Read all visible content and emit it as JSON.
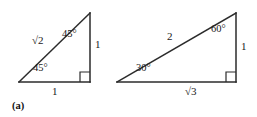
{
  "figure": {
    "caption": "(a)",
    "stroke_color": "#2b2b2b",
    "text_color": "#1a1a1a",
    "background_color": "#ffffff",
    "triangles": [
      {
        "name": "45-45-90-triangle",
        "hypotenuse_label": "√2",
        "vertical_leg_label": "1",
        "base_label": "1",
        "apex_angle_label": "45°",
        "base_angle_label": "45°",
        "right_angle_marker": true,
        "vertices": {
          "apex": [
            90,
            13
          ],
          "bottom_left": [
            19,
            82
          ],
          "bottom_right": [
            90,
            82
          ]
        }
      },
      {
        "name": "30-60-90-triangle",
        "hypotenuse_label": "2",
        "vertical_leg_label": "1",
        "base_label": "√3",
        "apex_angle_label": "60°",
        "base_angle_label": "30°",
        "right_angle_marker": true,
        "vertices": {
          "apex": [
            236,
            13
          ],
          "bottom_left": [
            117,
            82
          ],
          "bottom_right": [
            236,
            82
          ]
        }
      }
    ]
  }
}
